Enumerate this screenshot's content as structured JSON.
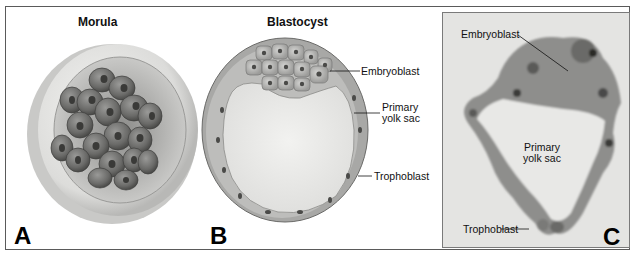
{
  "figure": {
    "panels": [
      {
        "letter": "A",
        "title": "Morula",
        "labels": []
      },
      {
        "letter": "B",
        "title": "Blastocyst",
        "labels": [
          "Embryoblast",
          "Primary",
          "yolk sac",
          "Trophoblast"
        ]
      },
      {
        "letter": "C",
        "title": "",
        "labels": [
          "Embryoblast",
          "Primary",
          "yolk sac",
          "Trophoblast"
        ]
      }
    ]
  }
}
